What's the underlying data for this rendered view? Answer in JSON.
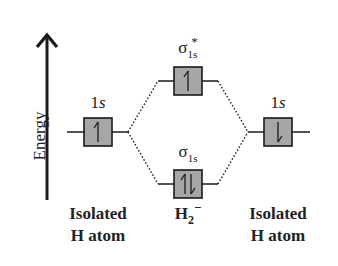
{
  "axis": {
    "label": "Energy",
    "direction": "up"
  },
  "orbitals": {
    "left_atomic": {
      "label_main": "1",
      "label_italic": "s",
      "electrons": "up",
      "electron_count": 1
    },
    "antibonding": {
      "symbol": "σ",
      "subscript": "1s",
      "superscript": "*",
      "electrons": "up",
      "electron_count": 1
    },
    "bonding": {
      "symbol": "σ",
      "subscript": "1s",
      "electrons": "up-down",
      "electron_count": 2
    },
    "right_atomic": {
      "label_main": "1",
      "label_italic": "s",
      "electrons": "down",
      "electron_count": 1
    }
  },
  "columns": {
    "left": {
      "line1": "Isolated",
      "line2": "H atom"
    },
    "center": {
      "main": "H",
      "subscript": "2",
      "superscript": "−"
    },
    "right": {
      "line1": "Isolated",
      "line2": "H atom"
    }
  },
  "colors": {
    "box_fill": "#a6a6a6",
    "line": "#1a1a1a",
    "background": "#ffffff"
  }
}
